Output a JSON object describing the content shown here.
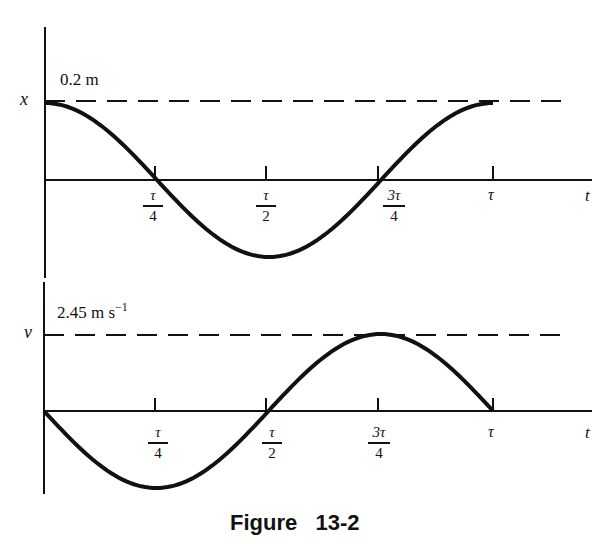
{
  "chart_data": [
    {
      "type": "line",
      "title": "Displacement vs time",
      "ylabel": "x",
      "xlabel": "t",
      "amplitude_label": "0.2 m",
      "amplitude": 0.2,
      "x_ticks": [
        "τ/4",
        "τ/2",
        "3τ/4",
        "τ"
      ],
      "x": [
        0,
        0.25,
        0.5,
        0.75,
        1.0
      ],
      "values": [
        0.2,
        0,
        -0.2,
        0,
        0.2
      ],
      "function": "x = 0.2 cos(2πt/τ)",
      "reference_line": {
        "style": "dashed",
        "value": 0.2
      },
      "grid": false
    },
    {
      "type": "line",
      "title": "Velocity vs time",
      "ylabel": "v",
      "xlabel": "t",
      "amplitude_label": "2.45 m s⁻¹",
      "amplitude": 2.45,
      "x_ticks": [
        "τ/4",
        "τ/2",
        "3τ/4",
        "τ"
      ],
      "x": [
        0,
        0.25,
        0.5,
        0.75,
        1.0
      ],
      "values": [
        0,
        -2.45,
        0,
        2.45,
        0
      ],
      "function": "v = -2.45 sin(2πt/τ)",
      "reference_line": {
        "style": "dashed",
        "value": 2.45
      },
      "grid": false
    }
  ],
  "figure": {
    "caption": "Figure   13-2"
  },
  "top_plot": {
    "y_axis_label": "x",
    "t_axis_label": "t",
    "amplitude_label": "0.2 m",
    "ticks": [
      {
        "num": "τ",
        "den": "4"
      },
      {
        "num": "τ",
        "den": "2"
      },
      {
        "num": "3τ",
        "den": "4"
      }
    ],
    "last_tick": "τ"
  },
  "bottom_plot": {
    "y_axis_label": "v",
    "t_axis_label": "t",
    "amplitude_label_main": "2.45 m s",
    "amplitude_label_sup": "−1",
    "ticks": [
      {
        "num": "τ",
        "den": "4"
      },
      {
        "num": "τ",
        "den": "2"
      },
      {
        "num": "3τ",
        "den": "4"
      }
    ],
    "last_tick": "τ"
  }
}
